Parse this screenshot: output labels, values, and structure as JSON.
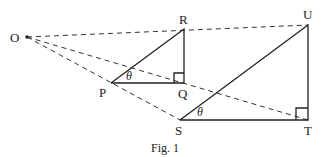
{
  "figure": {
    "caption": "Fig. 1",
    "points": {
      "O": {
        "label": "O",
        "x": 27,
        "y": 37
      },
      "P": {
        "label": "P",
        "x": 111,
        "y": 83
      },
      "Q": {
        "label": "Q",
        "x": 184,
        "y": 83
      },
      "R": {
        "label": "R",
        "x": 184,
        "y": 29
      },
      "S": {
        "label": "S",
        "x": 180,
        "y": 120
      },
      "T": {
        "label": "T",
        "x": 308,
        "y": 120
      },
      "U": {
        "label": "U",
        "x": 308,
        "y": 25
      }
    },
    "angle_label": "θ",
    "triangles": [
      {
        "name": "PQR",
        "right_angle_at": "Q",
        "angle_theta_at": "P"
      },
      {
        "name": "STU",
        "right_angle_at": "T",
        "angle_theta_at": "S"
      }
    ],
    "dashed_rays": [
      "O-R-U",
      "O-Q-T",
      "O-P-S"
    ],
    "colors": {
      "line": "#222222",
      "background": "#ffffff"
    }
  }
}
